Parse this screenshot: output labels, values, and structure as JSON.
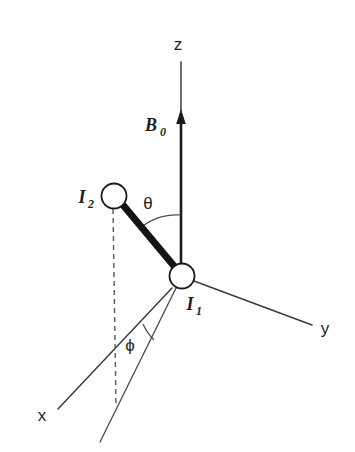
{
  "figure": {
    "type": "vector-diagram",
    "title": "",
    "background_color": "#ffffff",
    "ink_color": "#231f20",
    "width": 355,
    "height": 452
  },
  "axes": [
    {
      "id": "z",
      "label": "z",
      "label_x": 178,
      "label_y": 50,
      "line": {
        "x1": 181,
        "y1": 62,
        "x2": 181,
        "y2": 272
      }
    },
    {
      "id": "y",
      "label": "y",
      "label_x": 325,
      "label_y": 334,
      "line": {
        "x1": 194,
        "y1": 281,
        "x2": 312,
        "y2": 325
      }
    },
    {
      "id": "x",
      "label": "x",
      "label_x": 42,
      "label_y": 421,
      "line": {
        "x1": 172,
        "y1": 288,
        "x2": 58,
        "y2": 409
      }
    }
  ],
  "field_vector": {
    "label": "B",
    "subscript": "0",
    "label_x": 151,
    "label_y": 131,
    "sub_x": 166,
    "sub_y": 136,
    "shaft": {
      "x1": 181,
      "y1": 272,
      "x2": 181,
      "y2": 122
    },
    "arrow_tip_y": 109,
    "arrow_half_width": 5
  },
  "nuclei": [
    {
      "id": "I1",
      "label": "I",
      "subscript": "1",
      "cx": 182,
      "cy": 276,
      "r": 12.5,
      "label_x": 190,
      "label_y": 310,
      "sub_x": 198,
      "sub_y": 315
    },
    {
      "id": "I2",
      "label": "I",
      "subscript": "2",
      "cx": 114,
      "cy": 196,
      "r": 12.5,
      "label_x": 81,
      "label_y": 203,
      "sub_x": 90,
      "sub_y": 208
    }
  ],
  "internuclear_rod": {
    "x1": 123,
    "y1": 205,
    "x2": 179,
    "y2": 272
  },
  "projection_line": {
    "x1": 179,
    "y1": 282,
    "x2": 100,
    "y2": 442
  },
  "dashed_drop_line": {
    "x1": 113,
    "y1": 209,
    "x2": 116,
    "y2": 406
  },
  "angles": [
    {
      "id": "theta",
      "glyph": "θ",
      "label_x": 146,
      "label_y": 209,
      "arc_path": "M 181 215 A 57 57 0 0 0 140 228",
      "between": [
        "z-axis",
        "internuclear-rod"
      ]
    },
    {
      "id": "phi",
      "glyph": "ϕ",
      "label_x": 128,
      "label_y": 351,
      "arc_path": "M 144 325 A 52 52 0 0 0 155 339",
      "between": [
        "x-axis",
        "projection-line"
      ]
    }
  ]
}
